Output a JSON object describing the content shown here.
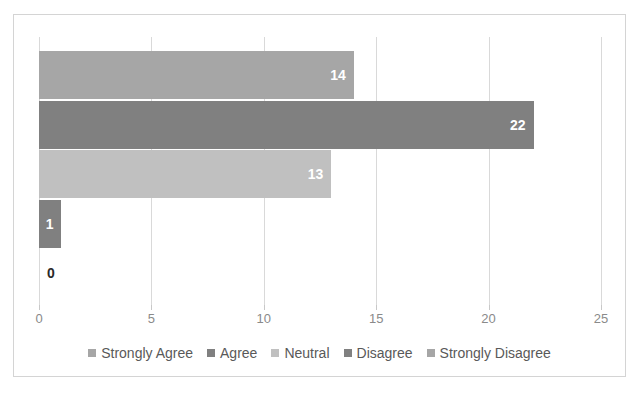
{
  "chart_data": {
    "type": "bar",
    "orientation": "horizontal",
    "title": "",
    "xlabel": "",
    "ylabel": "",
    "xlim": [
      0,
      25
    ],
    "xticks": [
      0,
      5,
      10,
      15,
      20,
      25
    ],
    "xtick_labels": [
      "0",
      "5",
      "10",
      "15",
      "20",
      "25"
    ],
    "grid": true,
    "legend_position": "bottom",
    "categories": [
      "Strongly Agree",
      "Agree",
      "Neutral",
      "Disagree",
      "Strongly Disagree"
    ],
    "values": [
      14,
      22,
      13,
      1,
      0
    ],
    "data_labels": [
      "14",
      "22",
      "13",
      "1",
      "0"
    ],
    "colors": [
      "#a6a6a6",
      "#808080",
      "#c0c0c0",
      "#808080",
      "#a6a6a6"
    ],
    "bars": [
      {
        "category": "Strongly Agree",
        "value": 14,
        "label": "14",
        "color": "#a6a6a6",
        "label_inside": true
      },
      {
        "category": "Agree",
        "value": 22,
        "label": "22",
        "color": "#808080",
        "label_inside": true
      },
      {
        "category": "Neutral",
        "value": 13,
        "label": "13",
        "color": "#c0c0c0",
        "label_inside": true
      },
      {
        "category": "Disagree",
        "value": 1,
        "label": "1",
        "color": "#808080",
        "label_inside": true
      },
      {
        "category": "Strongly Disagree",
        "value": 0,
        "label": "0",
        "color": "#a6a6a6",
        "label_inside": false
      }
    ]
  },
  "legend": {
    "items": [
      {
        "label": "Strongly Agree",
        "color": "#a6a6a6"
      },
      {
        "label": "Agree",
        "color": "#808080"
      },
      {
        "label": "Neutral",
        "color": "#c0c0c0"
      },
      {
        "label": "Disagree",
        "color": "#808080"
      },
      {
        "label": "Strongly Disagree",
        "color": "#a6a6a6"
      }
    ]
  },
  "axis": {
    "tick_labels": [
      "0",
      "5",
      "10",
      "15",
      "20",
      "25"
    ]
  },
  "style": {
    "border_color": "#d4d4d4",
    "gridline_color": "#d9d9d9",
    "tick_label_color": "#8a8a8a",
    "legend_text_color": "#595959",
    "inside_label_color": "#ffffff",
    "outside_label_color": "#2a2a2a"
  }
}
